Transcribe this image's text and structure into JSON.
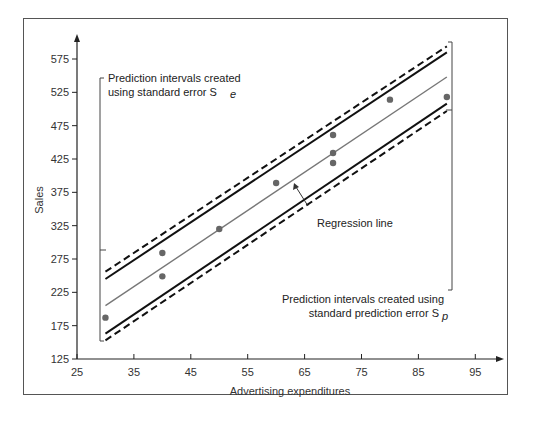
{
  "chart_data": {
    "type": "scatter",
    "title": "",
    "xlabel": "Advertising expenditures",
    "ylabel": "Sales",
    "xlim": [
      25,
      100
    ],
    "ylim": [
      125,
      600
    ],
    "x_ticks": [
      25,
      35,
      45,
      55,
      65,
      75,
      85,
      95
    ],
    "y_ticks": [
      125,
      175,
      225,
      275,
      325,
      375,
      425,
      475,
      525,
      575
    ],
    "grid": false,
    "series": [
      {
        "name": "Observations",
        "type": "scatter",
        "points": [
          {
            "x": 30,
            "y": 187
          },
          {
            "x": 40,
            "y": 284
          },
          {
            "x": 40,
            "y": 249
          },
          {
            "x": 50,
            "y": 320
          },
          {
            "x": 60,
            "y": 389
          },
          {
            "x": 70,
            "y": 419
          },
          {
            "x": 70,
            "y": 434
          },
          {
            "x": 70,
            "y": 461
          },
          {
            "x": 80,
            "y": 514
          },
          {
            "x": 90,
            "y": 518
          }
        ]
      },
      {
        "name": "Regression line",
        "type": "line",
        "x": [
          30,
          90
        ],
        "y": [
          205,
          548
        ]
      },
      {
        "name": "Upper interval (Se)",
        "type": "line",
        "style": "solid",
        "x": [
          30,
          90
        ],
        "y": [
          245,
          585
        ]
      },
      {
        "name": "Lower interval (Se)",
        "type": "line",
        "style": "solid",
        "x": [
          30,
          90
        ],
        "y": [
          163,
          508
        ]
      },
      {
        "name": "Upper interval (Sp)",
        "type": "line",
        "style": "dashed",
        "x": [
          30,
          90
        ],
        "y": [
          256,
          594
        ]
      },
      {
        "name": "Lower interval (Sp)",
        "type": "line",
        "style": "dashed",
        "x": [
          30,
          90
        ],
        "y": [
          153,
          497
        ]
      }
    ],
    "annotations": [
      {
        "text": "Prediction intervals created using standard error S_e",
        "position": "upper-left"
      },
      {
        "text": "Regression line",
        "position": "center"
      },
      {
        "text": "Prediction intervals created using standard prediction error S_p",
        "position": "lower-right"
      }
    ]
  },
  "labels": {
    "ylabel": "Sales",
    "xlabel": "Advertising expenditures",
    "ann_se_line1": "Prediction intervals created",
    "ann_se_line2": "using standard error S",
    "ann_se_sub": "e",
    "ann_reg": "Regression line",
    "ann_sp_line1": "Prediction intervals created using",
    "ann_sp_line2": "standard prediction error S",
    "ann_sp_sub": "p"
  }
}
